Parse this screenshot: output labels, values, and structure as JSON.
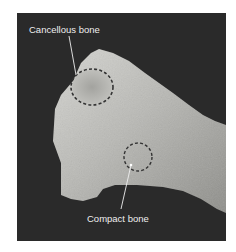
{
  "figure": {
    "background_color": "#2a2a2a",
    "bone_color": "#b8b8b4",
    "annotations": [
      {
        "label": "Cancellous bone",
        "marker": "dashed-circle",
        "region": "exposed end"
      },
      {
        "label": "Compact bone",
        "marker": "dashed-circle",
        "region": "outer shaft surface"
      }
    ]
  }
}
